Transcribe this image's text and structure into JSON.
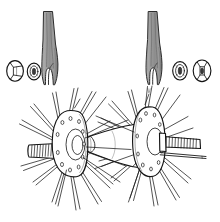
{
  "figure": {
    "style": "line-art-technical-illustration",
    "background_color": "#ffffff",
    "ink_color": "#1a1a1a",
    "fork_fill_color": "#969696",
    "fork_shade_light": "#c2c2c2",
    "fork_shade_dark": "#7a7a7a",
    "canvas": {
      "width": 220,
      "height": 222
    }
  },
  "parts": {
    "fork_blade_left": {
      "name": "Left fork blade with dropout slot",
      "label": "fork-blade-left",
      "position": {
        "x": 38,
        "y": 10,
        "width": 30,
        "height": 78
      }
    },
    "fork_blade_right": {
      "name": "Right fork blade with dropout slot",
      "label": "fork-blade-right",
      "position": {
        "x": 142,
        "y": 10,
        "width": 30,
        "height": 78
      }
    },
    "axle_nut_left": {
      "name": "Hex axle nut, left side",
      "label": "axle-nut-left",
      "position": {
        "x": 7,
        "y": 60,
        "width": 18,
        "height": 22
      }
    },
    "washer_left": {
      "name": "Keyed washer, left side",
      "label": "washer-left",
      "position": {
        "x": 27,
        "y": 63,
        "width": 14,
        "height": 17
      }
    },
    "washer_right": {
      "name": "Keyed washer, right side",
      "label": "washer-right",
      "position": {
        "x": 172,
        "y": 62,
        "width": 15,
        "height": 18
      }
    },
    "axle_nut_right": {
      "name": "Hex axle nut, right side",
      "label": "axle-nut-right",
      "position": {
        "x": 193,
        "y": 60,
        "width": 18,
        "height": 22
      }
    },
    "hub_flange_left": {
      "name": "Left hub flange with spoke holes",
      "label": "hub-flange-left",
      "spoke_hole_count": 10,
      "position": {
        "x": 50,
        "y": 110,
        "width": 50,
        "height": 72
      }
    },
    "hub_flange_right": {
      "name": "Right hub flange with spoke holes",
      "label": "hub-flange-right",
      "spoke_hole_count": 10,
      "position": {
        "x": 130,
        "y": 105,
        "width": 48,
        "height": 72
      }
    },
    "hub_shell": {
      "name": "Hub barrel shell between flanges",
      "label": "hub-shell",
      "position": {
        "x": 95,
        "y": 125,
        "width": 55,
        "height": 42
      }
    },
    "axle_left_thread": {
      "name": "Threaded axle end, left",
      "label": "axle-thread-left",
      "thread_count": 13,
      "position": {
        "x": 28,
        "y": 144,
        "width": 44,
        "height": 14
      }
    },
    "axle_right_thread": {
      "name": "Threaded axle end, right",
      "label": "axle-thread-right",
      "thread_count": 11,
      "position": {
        "x": 162,
        "y": 136,
        "width": 42,
        "height": 13
      }
    },
    "spokes_left": {
      "name": "Spokes radiating from left flange",
      "label": "spoke-group-left",
      "count": 22
    },
    "spokes_right": {
      "name": "Spokes radiating from right flange",
      "label": "spoke-group-right",
      "count": 22
    }
  },
  "annotations": {
    "visible_text": "",
    "caption": ""
  }
}
